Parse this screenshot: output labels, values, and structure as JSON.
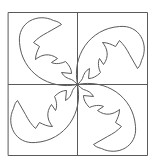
{
  "figure": {
    "description": "Square tile divided into four quadrants with four scalloped leaf/blade shapes rotating around the center (pinwheel)",
    "background": "#ffffff",
    "line_color": "#5a5a5a",
    "line_width": 1,
    "frame": {
      "x": 8,
      "y": 12,
      "width": 139,
      "height": 143
    },
    "center": {
      "x": 77,
      "y": 84
    },
    "blades": [
      {
        "quadrant": "top-right",
        "rotation": 0
      },
      {
        "quadrant": "bottom-right",
        "rotation": 90
      },
      {
        "quadrant": "bottom-left",
        "rotation": 180
      },
      {
        "quadrant": "top-left",
        "rotation": 270
      }
    ]
  }
}
